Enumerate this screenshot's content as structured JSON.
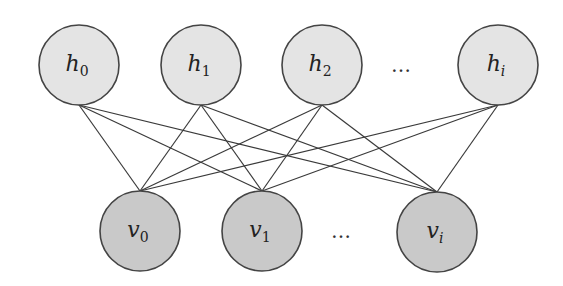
{
  "diagram": {
    "type": "bipartite-network",
    "colors": {
      "background": "#ffffff",
      "hidden_fill": "#e4e4e4",
      "visible_fill": "#c9c9c9",
      "stroke": "#444444",
      "edge": "#3a3a3a"
    },
    "radius": 40,
    "hidden_layer": [
      {
        "id": "h0",
        "var": "h",
        "sub": "0",
        "cx": 79,
        "cy": 65
      },
      {
        "id": "h1",
        "var": "h",
        "sub": "1",
        "cx": 201,
        "cy": 65
      },
      {
        "id": "h2",
        "var": "h",
        "sub": "2",
        "cx": 322,
        "cy": 65
      },
      {
        "id": "hi",
        "var": "h",
        "sub": "i",
        "cx": 498,
        "cy": 65
      }
    ],
    "visible_layer": [
      {
        "id": "v0",
        "var": "v",
        "sub": "0",
        "cx": 140,
        "cy": 231
      },
      {
        "id": "v1",
        "var": "v",
        "sub": "1",
        "cx": 262,
        "cy": 231
      },
      {
        "id": "vi",
        "var": "v",
        "sub": "i",
        "cx": 437,
        "cy": 232
      }
    ],
    "ellipses": [
      {
        "text": "…",
        "x": 401,
        "y": 72
      },
      {
        "text": "…",
        "x": 341,
        "y": 238
      }
    ],
    "edges": [
      [
        "h0",
        "v0"
      ],
      [
        "h0",
        "v1"
      ],
      [
        "h0",
        "vi"
      ],
      [
        "h1",
        "v0"
      ],
      [
        "h1",
        "v1"
      ],
      [
        "h1",
        "vi"
      ],
      [
        "h2",
        "v0"
      ],
      [
        "h2",
        "v1"
      ],
      [
        "h2",
        "vi"
      ],
      [
        "hi",
        "v0"
      ],
      [
        "hi",
        "v1"
      ],
      [
        "hi",
        "vi"
      ]
    ]
  }
}
